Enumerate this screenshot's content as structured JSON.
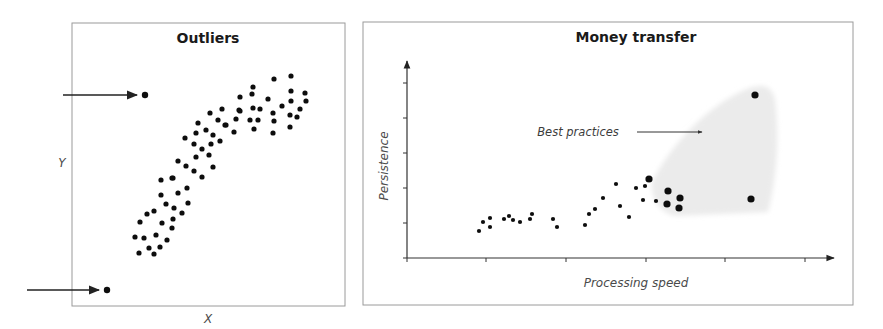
{
  "chart_data": [
    {
      "type": "scatter",
      "title": "Outliers",
      "xlabel": "X",
      "ylabel": "Y",
      "grid": false,
      "legend": null,
      "annotations": [
        {
          "type": "arrow",
          "target": "top-left outlier",
          "from": [
            63,
            95
          ],
          "to": [
            136,
            95
          ]
        },
        {
          "type": "arrow",
          "target": "bottom-left outlier",
          "from": [
            27,
            290
          ],
          "to": [
            98,
            290
          ]
        }
      ],
      "outliers_px": [
        [
          145,
          95
        ],
        [
          107,
          290
        ]
      ],
      "points_px": [
        [
          139,
          253
        ],
        [
          149,
          248
        ],
        [
          154,
          254
        ],
        [
          160,
          247
        ],
        [
          135,
          237
        ],
        [
          144,
          238
        ],
        [
          156,
          235
        ],
        [
          167,
          240
        ],
        [
          140,
          222
        ],
        [
          162,
          223
        ],
        [
          173,
          219
        ],
        [
          172,
          228
        ],
        [
          147,
          214
        ],
        [
          154,
          211
        ],
        [
          182,
          213
        ],
        [
          166,
          204
        ],
        [
          174,
          208
        ],
        [
          188,
          203
        ],
        [
          161,
          195
        ],
        [
          178,
          193
        ],
        [
          187,
          188
        ],
        [
          161,
          180
        ],
        [
          173,
          178
        ],
        [
          172,
          178
        ],
        [
          178,
          161
        ],
        [
          186,
          166
        ],
        [
          194,
          171
        ],
        [
          213,
          167
        ],
        [
          202,
          177
        ],
        [
          196,
          157
        ],
        [
          209,
          155
        ],
        [
          202,
          149
        ],
        [
          185,
          138
        ],
        [
          194,
          144
        ],
        [
          211,
          144
        ],
        [
          220,
          141
        ],
        [
          196,
          133
        ],
        [
          213,
          135
        ],
        [
          198,
          123
        ],
        [
          206,
          130
        ],
        [
          218,
          120
        ],
        [
          225,
          125
        ],
        [
          236,
          119
        ],
        [
          234,
          132
        ],
        [
          210,
          113
        ],
        [
          222,
          109
        ],
        [
          240,
          97
        ],
        [
          240,
          111
        ],
        [
          252,
          94
        ],
        [
          253,
          87
        ],
        [
          274,
          79
        ],
        [
          291,
          76
        ],
        [
          291,
          91
        ],
        [
          305,
          93
        ],
        [
          268,
          99
        ],
        [
          291,
          101
        ],
        [
          306,
          101
        ],
        [
          282,
          106
        ],
        [
          300,
          109
        ],
        [
          239,
          110
        ],
        [
          253,
          108
        ],
        [
          260,
          109
        ],
        [
          273,
          113
        ],
        [
          290,
          115
        ],
        [
          297,
          117
        ],
        [
          250,
          120
        ],
        [
          258,
          120
        ],
        [
          274,
          121
        ],
        [
          226,
          125
        ],
        [
          254,
          129
        ],
        [
          273,
          133
        ],
        [
          290,
          127
        ]
      ]
    },
    {
      "type": "scatter",
      "title": "Money transfer",
      "xlabel": "Processing speed",
      "ylabel": "Persistence",
      "grid": false,
      "legend": null,
      "x_ticks": 5,
      "y_ticks": 5,
      "annotations": [
        {
          "text": "Best practices",
          "type": "arrow-label",
          "points_to": "shaded region"
        }
      ],
      "highlight_region": "Best practices (light gray shaded area, upper right)",
      "points_px": [
        [
          479,
          231
        ],
        [
          483,
          222
        ],
        [
          490,
          218
        ],
        [
          490,
          227
        ],
        [
          504,
          219
        ],
        [
          509,
          216
        ],
        [
          513,
          220
        ],
        [
          520,
          222
        ],
        [
          530,
          219
        ],
        [
          532,
          214
        ],
        [
          553,
          219
        ],
        [
          557,
          227
        ],
        [
          585,
          225
        ],
        [
          589,
          214
        ],
        [
          595,
          209
        ],
        [
          603,
          198
        ],
        [
          616,
          184
        ],
        [
          620,
          206
        ],
        [
          629,
          217
        ],
        [
          636,
          188
        ],
        [
          645,
          186
        ],
        [
          643,
          200
        ],
        [
          656,
          201
        ]
      ],
      "best_practice_points_px": [
        [
          649,
          179
        ],
        [
          668,
          191
        ],
        [
          680,
          198
        ],
        [
          667,
          204
        ],
        [
          679,
          208
        ],
        [
          751,
          199
        ],
        [
          755,
          95
        ]
      ]
    }
  ],
  "panels": {
    "left": {
      "title": "Outliers",
      "xlabel": "X",
      "ylabel": "Y"
    },
    "right": {
      "title": "Money transfer",
      "xlabel": "Processing speed",
      "ylabel": "Persistence",
      "annotation": "Best practices"
    }
  },
  "colors": {
    "frame": "#9a9a9a",
    "axis": "#333333",
    "dot": "#111111",
    "region": "#ececec",
    "label": "#4a4a4a"
  }
}
